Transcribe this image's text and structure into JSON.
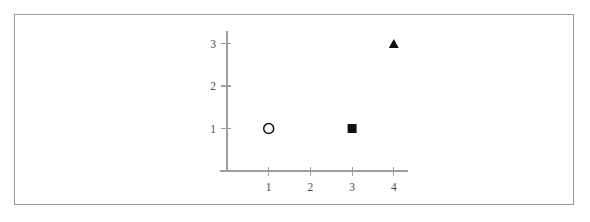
{
  "chart_data": {
    "type": "scatter",
    "title": "",
    "subtitle": "",
    "xlabel": "",
    "ylabel": "",
    "xlim": [
      0,
      4.35
    ],
    "ylim": [
      0,
      3.3
    ],
    "grid": false,
    "legend": "none",
    "x_ticks": [
      {
        "value": 1,
        "label": "1"
      },
      {
        "value": 2,
        "label": "2"
      },
      {
        "value": 3,
        "label": "3"
      },
      {
        "value": 4,
        "label": "4"
      }
    ],
    "y_ticks": [
      {
        "value": 1,
        "label": "1"
      },
      {
        "value": 2,
        "label": "2"
      },
      {
        "value": 3,
        "label": "3"
      }
    ],
    "series": [
      {
        "name": "open-circle",
        "marker": "open-circle",
        "color": "#111111",
        "filled": false,
        "points": [
          {
            "x": 1,
            "y": 1
          }
        ]
      },
      {
        "name": "filled-square",
        "marker": "filled-square",
        "color": "#111111",
        "filled": true,
        "points": [
          {
            "x": 3,
            "y": 1
          }
        ]
      },
      {
        "name": "filled-triangle",
        "marker": "filled-triangle",
        "color": "#111111",
        "filled": true,
        "points": [
          {
            "x": 4,
            "y": 3
          }
        ]
      }
    ],
    "points": [
      {
        "x": 1,
        "y": 1,
        "marker": "open-circle"
      },
      {
        "x": 3,
        "y": 1,
        "marker": "filled-square"
      },
      {
        "x": 4,
        "y": 3,
        "marker": "filled-triangle"
      }
    ]
  },
  "figure": {
    "frame_color": "#9a9a9a",
    "axis_color": "#9e9e9e",
    "background": "#ffffff",
    "marker_color": "#111111"
  }
}
